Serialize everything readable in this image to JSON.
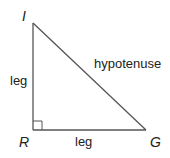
{
  "diagram": {
    "type": "right-triangle",
    "vertices": {
      "top": "I",
      "right_angle": "R",
      "bottom_right": "G"
    },
    "labels": {
      "vertical_side": "leg",
      "horizontal_side": "leg",
      "slanted_side": "hypotenuse"
    },
    "colors": {
      "stroke": "#555555",
      "text": "#222222",
      "background": "#ffffff"
    }
  }
}
